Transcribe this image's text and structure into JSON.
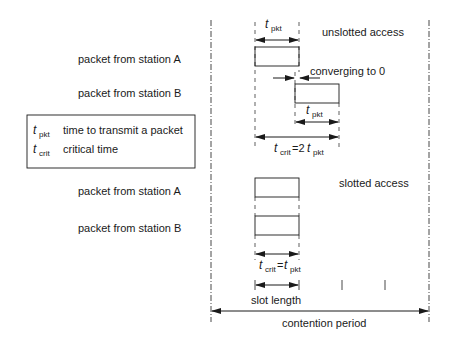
{
  "labels": {
    "unslotted": "unslotted access",
    "slotted": "slotted access",
    "packet_a": "packet from station A",
    "packet_b": "packet from station B",
    "converging": "converging to 0",
    "slot_length": "slot length",
    "contention_period": "contention period"
  },
  "symbols": {
    "t": "t",
    "pkt": "pkt",
    "crit": "crit",
    "eq2": "=2",
    "eq": "="
  },
  "legend": {
    "items": [
      {
        "symbol": "t",
        "sub": "pkt",
        "text": "time to transmit a packet"
      },
      {
        "symbol": "t",
        "sub": "crit",
        "text": "critical time"
      }
    ]
  },
  "colors": {
    "line": "#1a1a1a",
    "background": "#ffffff"
  }
}
